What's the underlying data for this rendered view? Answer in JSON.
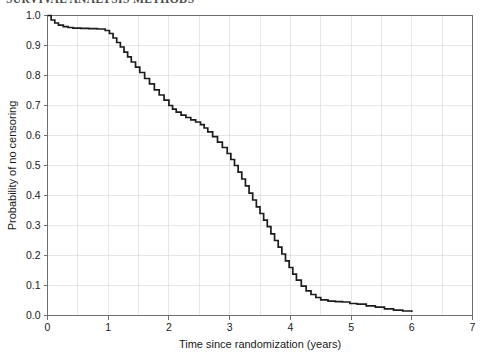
{
  "header": {
    "text": "SURVIVAL ANALYSIS  METHODS"
  },
  "figure": {
    "name": "kaplan-meier-censoring-plot"
  },
  "chart_data": {
    "type": "line",
    "title": "",
    "subtitle": "",
    "xlabel": "Time since randomization (years)",
    "ylabel": "Probability of no censoring",
    "xlim": [
      0,
      7
    ],
    "ylim": [
      0.0,
      1.0
    ],
    "xticks": [
      0,
      1,
      2,
      3,
      4,
      5,
      6,
      7
    ],
    "xtick_labels": [
      "0",
      "1",
      "2",
      "3",
      "4",
      "5",
      "6",
      "7"
    ],
    "yticks": [
      0.0,
      0.1,
      0.2,
      0.3,
      0.4,
      0.5,
      0.6,
      0.7,
      0.8,
      0.9,
      1.0
    ],
    "ytick_labels": [
      "0.0",
      "0.1",
      "0.2",
      "0.3",
      "0.4",
      "0.5",
      "0.6",
      "0.7",
      "0.8",
      "0.9",
      "1.0"
    ],
    "grid": true,
    "grid_x_step": 0.5,
    "grid_y_step": 0.1,
    "grid_color": "#dcdcdc",
    "legend": null,
    "series": [
      {
        "name": "Probability of no censoring",
        "step": "post",
        "color": "#1c1c1c",
        "x": [
          0.0,
          0.06,
          0.12,
          0.18,
          0.26,
          0.34,
          0.42,
          0.55,
          0.68,
          0.82,
          0.95,
          1.02,
          1.08,
          1.14,
          1.2,
          1.26,
          1.32,
          1.38,
          1.45,
          1.52,
          1.6,
          1.68,
          1.76,
          1.84,
          1.92,
          2.0,
          2.06,
          2.12,
          2.2,
          2.28,
          2.36,
          2.44,
          2.52,
          2.58,
          2.64,
          2.72,
          2.8,
          2.88,
          2.96,
          3.02,
          3.08,
          3.14,
          3.2,
          3.26,
          3.32,
          3.38,
          3.44,
          3.5,
          3.56,
          3.62,
          3.68,
          3.74,
          3.8,
          3.86,
          3.92,
          3.98,
          4.04,
          4.1,
          4.18,
          4.26,
          4.34,
          4.42,
          4.5,
          4.62,
          4.74,
          4.86,
          4.98,
          5.1,
          5.25,
          5.4,
          5.55,
          5.7,
          5.85,
          6.0
        ],
        "y": [
          1.0,
          0.985,
          0.975,
          0.968,
          0.963,
          0.96,
          0.958,
          0.957,
          0.956,
          0.955,
          0.95,
          0.94,
          0.925,
          0.91,
          0.895,
          0.878,
          0.862,
          0.845,
          0.828,
          0.81,
          0.79,
          0.772,
          0.752,
          0.735,
          0.718,
          0.7,
          0.688,
          0.678,
          0.668,
          0.66,
          0.652,
          0.645,
          0.636,
          0.625,
          0.612,
          0.596,
          0.578,
          0.56,
          0.54,
          0.52,
          0.5,
          0.478,
          0.455,
          0.432,
          0.408,
          0.385,
          0.362,
          0.34,
          0.318,
          0.296,
          0.272,
          0.25,
          0.228,
          0.205,
          0.182,
          0.16,
          0.138,
          0.118,
          0.098,
          0.082,
          0.07,
          0.06,
          0.052,
          0.048,
          0.046,
          0.045,
          0.04,
          0.038,
          0.032,
          0.028,
          0.022,
          0.018,
          0.015,
          0.012
        ]
      }
    ]
  }
}
